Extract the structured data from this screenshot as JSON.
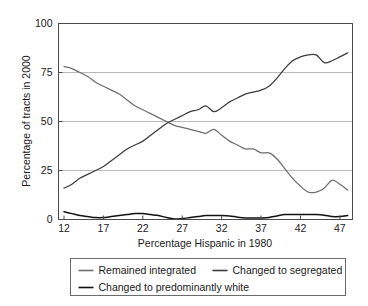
{
  "chart_data": {
    "type": "line",
    "title": "",
    "xlabel": "Percentage Hispanic in 1980",
    "ylabel": "Percentage of tracts in 2000",
    "xlim": [
      11.3,
      48.6
    ],
    "ylim": [
      0,
      100
    ],
    "xticks": [
      12,
      17,
      22,
      27,
      32,
      37,
      42,
      47
    ],
    "xtick_labels": [
      "12",
      "17",
      "22",
      "27",
      "32",
      "37",
      "42",
      "47"
    ],
    "yticks": [
      0,
      25,
      50,
      75,
      100
    ],
    "ytick_labels": [
      "0",
      "25",
      "50",
      "75",
      "100"
    ],
    "grid": "horizontal",
    "legend_position": "below-axes",
    "x": [
      12,
      13,
      14,
      15,
      16,
      17,
      18,
      19,
      20,
      21,
      22,
      23,
      24,
      25,
      26,
      27,
      28,
      29,
      30,
      31,
      32,
      33,
      34,
      35,
      36,
      37,
      38,
      39,
      40,
      41,
      42,
      43,
      44,
      45,
      46,
      47,
      48
    ],
    "series": [
      {
        "name": "Remained integrated",
        "color": "#6e6e6e",
        "values": [
          78,
          77,
          75,
          73,
          70,
          68,
          66,
          64,
          61,
          58,
          56,
          54,
          52,
          50,
          48,
          47,
          46,
          45,
          44,
          46,
          43,
          40,
          38,
          36,
          36,
          34,
          34,
          31,
          26,
          21,
          17,
          14,
          14,
          16,
          20,
          18,
          15
        ]
      },
      {
        "name": "Changed to segregated",
        "color": "#3c3c3c",
        "values": [
          16,
          18,
          21,
          23,
          25,
          27,
          30,
          33,
          36,
          38,
          40,
          43,
          46,
          49,
          51,
          53,
          55,
          56,
          58,
          55,
          57,
          60,
          62,
          64,
          65,
          66,
          68,
          72,
          77,
          81,
          83,
          84,
          84,
          80,
          81,
          83,
          85
        ]
      },
      {
        "name": "Changed to predominantly white",
        "color": "#111111",
        "values": [
          4,
          3,
          2,
          1.5,
          1,
          1,
          1.5,
          2,
          2.5,
          3,
          3,
          2.5,
          2,
          1,
          0.3,
          0.5,
          1,
          1.5,
          2,
          2,
          2,
          1.8,
          1.2,
          0.8,
          0.8,
          0.8,
          1,
          1.8,
          2.5,
          2.5,
          2.5,
          2.5,
          2.5,
          2.2,
          1.5,
          1.5,
          2
        ]
      }
    ],
    "legend_entries": [
      {
        "label": "Remained integrated",
        "color": "#6e6e6e"
      },
      {
        "label": "Changed to segregated",
        "color": "#3c3c3c"
      },
      {
        "label": "Changed to predominantly white",
        "color": "#111111"
      }
    ]
  }
}
